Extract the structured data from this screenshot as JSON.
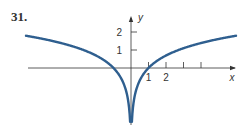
{
  "problem_number": "31.",
  "chart_data": {
    "type": "line",
    "title": "",
    "function": "y = ln|x|",
    "xlabel": "x",
    "ylabel": "y",
    "x_ticks": [
      1,
      2,
      3,
      4
    ],
    "x_tick_labels": [
      "1",
      "2"
    ],
    "y_ticks": [
      1,
      2
    ],
    "y_tick_labels": [
      "1",
      "2"
    ],
    "xlim": [
      -6,
      6.5
    ],
    "ylim": [
      -4,
      2.2
    ],
    "grid": false,
    "series": [
      {
        "name": "ln|x| (x>0)",
        "x": [
          0.05,
          0.1,
          0.25,
          0.5,
          1,
          2,
          3,
          4,
          5,
          6
        ],
        "y": [
          -3.0,
          -2.3,
          -1.39,
          -0.69,
          0,
          0.69,
          1.1,
          1.39,
          1.61,
          1.79
        ]
      },
      {
        "name": "ln|x| (x<0)",
        "x": [
          -6,
          -5,
          -4,
          -3,
          -2,
          -1,
          -0.5,
          -0.25,
          -0.1,
          -0.05
        ],
        "y": [
          1.79,
          1.61,
          1.39,
          1.1,
          0.69,
          0,
          -0.69,
          -1.39,
          -2.3,
          -3.0
        ]
      }
    ],
    "colors": {
      "curve": "#2f5f8f",
      "axis": "#333333"
    }
  }
}
